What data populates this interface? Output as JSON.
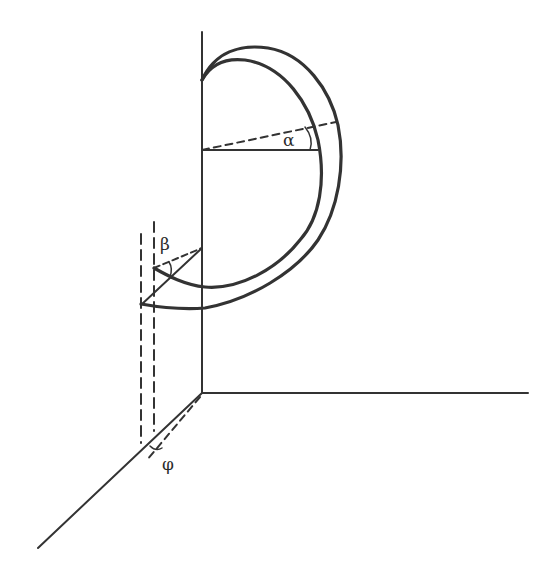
{
  "figure": {
    "type": "3D geometric diagram",
    "colors": {
      "line": "#333333",
      "background": "#ffffff"
    }
  },
  "labels": {
    "alpha": "α",
    "beta": "β",
    "phi": "φ"
  },
  "axes": {
    "vertical": {
      "x": 202,
      "y_top": 32,
      "y_bottom": 393
    },
    "horizontal": {
      "x_start": 202,
      "x_end": 528,
      "y": 393
    },
    "diagonal": {
      "from": [
        202,
        393
      ],
      "to": [
        38,
        548
      ]
    }
  }
}
